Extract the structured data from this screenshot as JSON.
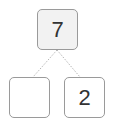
{
  "number_bond": {
    "whole": {
      "value": "7",
      "fill": "#f2f2f2"
    },
    "parts": [
      {
        "position": "left",
        "value": "",
        "fill": "#ffffff"
      },
      {
        "position": "right",
        "value": "2",
        "fill": "#ffffff"
      }
    ],
    "border_color": "#9a9a9a",
    "connector_style": "dotted"
  }
}
